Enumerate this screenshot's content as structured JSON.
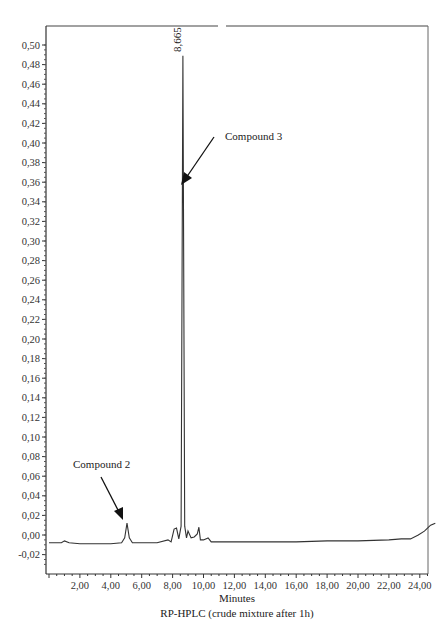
{
  "chart_data": {
    "type": "line",
    "title": "RP-HPLC (crude mixture after 1h)",
    "xlabel": "Minutes",
    "ylabel": "",
    "xlim": [
      0,
      25
    ],
    "ylim": [
      -0.03,
      0.51
    ],
    "grid": false,
    "legend": "none",
    "x_ticks": [
      "2,00",
      "4,00",
      "6,00",
      "8,00",
      "10,00",
      "12,00",
      "14,00",
      "16,00",
      "18,00",
      "20,00",
      "22,00",
      "24,00"
    ],
    "y_ticks": [
      "0,50",
      "0,48",
      "0,46",
      "0,44",
      "0,42",
      "0,40",
      "0,38",
      "0,36",
      "0,34",
      "0,32",
      "0,30",
      "0,28",
      "0,26",
      "0,24",
      "0,22",
      "0,20",
      "0,18",
      "0,16",
      "0,14",
      "0,12",
      "0,10",
      "0,08",
      "0,06",
      "0,04",
      "0,02",
      "0,00",
      "-0,02"
    ],
    "series": [
      {
        "name": "Absorbance",
        "x": [
          0.0,
          0.8,
          1.0,
          1.3,
          2.0,
          3.0,
          4.0,
          4.7,
          4.9,
          5.05,
          5.2,
          5.4,
          6.0,
          7.0,
          7.7,
          7.9,
          8.1,
          8.25,
          8.4,
          8.55,
          8.665,
          8.78,
          8.9,
          9.0,
          9.2,
          9.4,
          9.6,
          9.7,
          9.8,
          10.0,
          10.3,
          10.5,
          11.0,
          12.0,
          14.0,
          16.0,
          18.0,
          20.0,
          22.0,
          22.8,
          23.4,
          23.9,
          24.3,
          24.7,
          25.0
        ],
        "y": [
          -0.008,
          -0.008,
          -0.006,
          -0.008,
          -0.009,
          -0.009,
          -0.009,
          -0.008,
          -0.003,
          0.012,
          -0.003,
          -0.008,
          -0.008,
          -0.008,
          -0.005,
          -0.007,
          0.006,
          0.007,
          -0.004,
          0.009,
          0.489,
          0.009,
          -0.003,
          0.004,
          -0.003,
          -0.002,
          0.001,
          0.008,
          -0.005,
          -0.005,
          -0.003,
          -0.007,
          -0.007,
          -0.007,
          -0.007,
          -0.007,
          -0.006,
          -0.006,
          -0.005,
          -0.004,
          -0.004,
          0.0,
          0.004,
          0.01,
          0.012
        ]
      }
    ],
    "annotations": [
      {
        "text": "8,665",
        "x": 8.665,
        "y": 0.489,
        "orientation": "vertical"
      },
      {
        "text": "Compound 3",
        "arrow_to_x": 8.7,
        "arrow_to_y": 0.36
      },
      {
        "text": "Compound 2",
        "arrow_to_x": 5.0,
        "arrow_to_y": 0.015
      }
    ]
  },
  "labels": {
    "peak_label": "8,665",
    "compound3": "Compound 3",
    "compound2": "Compound 2",
    "xlabel": "Minutes",
    "title": "RP-HPLC (crude mixture after 1h)"
  }
}
